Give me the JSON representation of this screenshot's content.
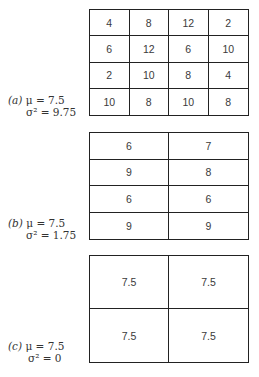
{
  "figure": {
    "panels": [
      {
        "tag": "(a)",
        "mean_label": "μ = 7.5",
        "variance_label": "σ² = 9.75",
        "columns": 4,
        "rows": 4,
        "cells": [
          [
            "4",
            "8",
            "12",
            "2"
          ],
          [
            "6",
            "12",
            "6",
            "10"
          ],
          [
            "2",
            "10",
            "8",
            "4"
          ],
          [
            "10",
            "8",
            "10",
            "8"
          ]
        ]
      },
      {
        "tag": "(b)",
        "mean_label": "μ = 7.5",
        "variance_label": "σ² = 1.75",
        "columns": 2,
        "rows": 4,
        "cells": [
          [
            "6",
            "7"
          ],
          [
            "9",
            "8"
          ],
          [
            "6",
            "6"
          ],
          [
            "9",
            "9"
          ]
        ]
      },
      {
        "tag": "(c)",
        "mean_label": "μ = 7.5",
        "variance_label": "σ² = 0",
        "columns": 2,
        "rows": 2,
        "cells": [
          [
            "7.5",
            "7.5"
          ],
          [
            "7.5",
            "7.5"
          ]
        ]
      }
    ]
  }
}
